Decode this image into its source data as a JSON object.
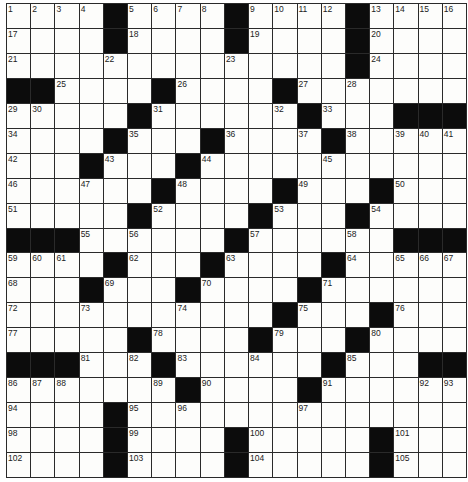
{
  "puzzle": {
    "rows": 19,
    "cols": 19,
    "legend": {
      "#": "black-square",
      "0": "empty-white-square",
      "n>0": "numbered-white-square"
    },
    "grid": [
      [
        1,
        2,
        3,
        4,
        "#",
        5,
        6,
        7,
        8,
        "#",
        9,
        10,
        11,
        12,
        "#",
        13,
        14,
        15,
        16
      ],
      [
        17,
        0,
        0,
        0,
        "#",
        18,
        0,
        0,
        0,
        "#",
        19,
        0,
        0,
        0,
        "#",
        20,
        0,
        0,
        0
      ],
      [
        21,
        0,
        0,
        0,
        22,
        0,
        0,
        0,
        0,
        23,
        0,
        0,
        0,
        0,
        "#",
        24,
        0,
        0,
        0
      ],
      [
        "#",
        "#",
        25,
        0,
        0,
        0,
        "#",
        26,
        0,
        0,
        0,
        "#",
        27,
        0,
        28,
        0,
        0,
        0,
        0
      ],
      [
        29,
        30,
        0,
        0,
        0,
        "#",
        31,
        0,
        0,
        0,
        0,
        32,
        "#",
        33,
        0,
        0,
        "#",
        "#",
        "#"
      ],
      [
        34,
        0,
        0,
        0,
        "#",
        35,
        0,
        0,
        "#",
        36,
        0,
        0,
        37,
        "#",
        38,
        0,
        39,
        40,
        41
      ],
      [
        42,
        0,
        0,
        "#",
        43,
        0,
        0,
        "#",
        44,
        0,
        0,
        0,
        0,
        45,
        0,
        0,
        0,
        0,
        0
      ],
      [
        46,
        0,
        0,
        47,
        0,
        0,
        "#",
        48,
        0,
        0,
        0,
        "#",
        49,
        0,
        0,
        "#",
        50,
        0,
        0
      ],
      [
        51,
        0,
        0,
        0,
        0,
        "#",
        52,
        0,
        0,
        0,
        "#",
        53,
        0,
        0,
        "#",
        54,
        0,
        0,
        0
      ],
      [
        "#",
        "#",
        "#",
        55,
        0,
        56,
        0,
        0,
        0,
        "#",
        57,
        0,
        0,
        0,
        58,
        0,
        "#",
        "#",
        "#"
      ],
      [
        59,
        60,
        61,
        0,
        "#",
        62,
        0,
        0,
        "#",
        63,
        0,
        0,
        0,
        "#",
        64,
        0,
        65,
        66,
        67
      ],
      [
        68,
        0,
        0,
        "#",
        69,
        0,
        0,
        "#",
        70,
        0,
        0,
        0,
        "#",
        71,
        0,
        0,
        0,
        0,
        0
      ],
      [
        72,
        0,
        0,
        73,
        0,
        0,
        0,
        74,
        0,
        0,
        0,
        "#",
        75,
        0,
        0,
        "#",
        76,
        0,
        0
      ],
      [
        77,
        0,
        0,
        0,
        0,
        "#",
        78,
        0,
        0,
        0,
        "#",
        79,
        0,
        0,
        "#",
        80,
        0,
        0,
        0
      ],
      [
        "#",
        "#",
        "#",
        81,
        0,
        82,
        "#",
        83,
        0,
        0,
        84,
        0,
        0,
        "#",
        85,
        0,
        0,
        "#",
        "#"
      ],
      [
        86,
        87,
        88,
        0,
        0,
        0,
        89,
        "#",
        90,
        0,
        0,
        0,
        "#",
        91,
        0,
        0,
        0,
        92,
        93
      ],
      [
        94,
        0,
        0,
        0,
        "#",
        95,
        0,
        96,
        0,
        0,
        0,
        0,
        97,
        0,
        0,
        0,
        0,
        0,
        0
      ],
      [
        98,
        0,
        0,
        0,
        "#",
        99,
        0,
        0,
        0,
        "#",
        100,
        0,
        0,
        0,
        0,
        "#",
        101,
        0,
        0
      ],
      [
        102,
        0,
        0,
        0,
        "#",
        103,
        0,
        0,
        0,
        "#",
        104,
        0,
        0,
        0,
        0,
        "#",
        105,
        0,
        0
      ]
    ]
  },
  "colors": {
    "white_square": "#fdfdfb",
    "black_square": "#0c0c0c",
    "grid_line": "#2a2a2a",
    "number_text": "#222222"
  }
}
